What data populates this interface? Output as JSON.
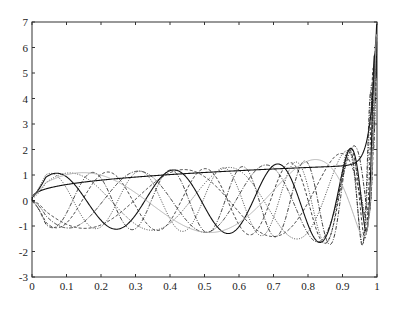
{
  "chart_data": {
    "type": "line",
    "title": "",
    "xlabel": "",
    "ylabel": "",
    "xlim": [
      0,
      1
    ],
    "ylim": [
      -3,
      7
    ],
    "grid": false,
    "legend": null,
    "x_ticks": [
      "0",
      "0.1",
      "0.2",
      "0.3",
      "0.4",
      "0.5",
      "0.6",
      "0.7",
      "0.8",
      "0.9",
      "1"
    ],
    "y_ticks": [
      "-3",
      "-2",
      "-1",
      "0",
      "1",
      "2",
      "3",
      "4",
      "5",
      "6",
      "7"
    ],
    "series": [
      {
        "name": "monotonic",
        "style": "solid",
        "kind": "mono",
        "end_value": 1.4
      },
      {
        "name": "f1",
        "style": "solid",
        "kind": "osc",
        "omega": 15.4,
        "phase": 0.32,
        "sign": 1
      },
      {
        "name": "f2",
        "style": "dashed",
        "kind": "osc",
        "omega": 9.0,
        "phase": 0.0,
        "sign": -1
      },
      {
        "name": "f3",
        "style": "dotted",
        "kind": "osc",
        "omega": 11.0,
        "phase": 0.2,
        "sign": 1
      },
      {
        "name": "f4",
        "style": "dashdot",
        "kind": "osc",
        "omega": 13.0,
        "phase": 0.0,
        "sign": -1
      },
      {
        "name": "f5",
        "style": "dashed",
        "kind": "osc",
        "omega": 18.0,
        "phase": 0.1,
        "sign": -1
      },
      {
        "name": "f6",
        "style": "dotted",
        "kind": "osc",
        "omega": 20.5,
        "phase": 0.3,
        "sign": 1
      },
      {
        "name": "f7",
        "style": "dashdot",
        "kind": "osc",
        "omega": 23.0,
        "phase": 0.0,
        "sign": -1
      },
      {
        "name": "f8",
        "style": "light",
        "kind": "osc",
        "omega": 7.0,
        "phase": 0.4,
        "sign": 1
      }
    ]
  }
}
